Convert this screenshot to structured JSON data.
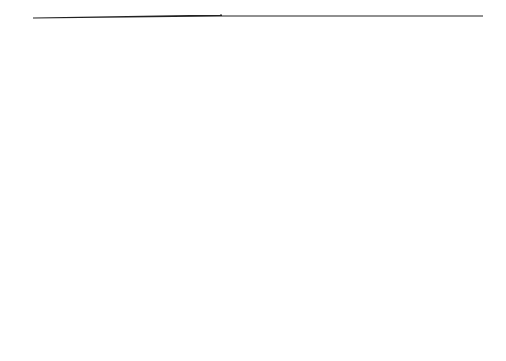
{
  "diagram": {
    "type": "entity-relationship",
    "colors": {
      "background": "#ffffff",
      "stroke": "#222222",
      "text": "#333333"
    },
    "entities": [
      {
        "id": "stock-location",
        "lines": [
          "Stock Location"
        ]
      },
      {
        "id": "warehouse",
        "lines": [
          "Warehouse"
        ]
      },
      {
        "id": "sales-office",
        "lines": [
          "Sales Office"
        ]
      },
      {
        "id": "person",
        "lines": [
          "Person"
        ]
      },
      {
        "id": "sales-person-leader",
        "lines": [
          "Sales Person",
          "(leader)"
        ]
      },
      {
        "id": "sales-person-general",
        "lines": [
          "Sales Person",
          "(general)"
        ]
      },
      {
        "id": "customer-orders",
        "lines": [
          "Customer",
          "(orders)"
        ]
      },
      {
        "id": "customer-credit",
        "lines": [
          "Customer",
          "(credit)"
        ]
      },
      {
        "id": "customer-mutations",
        "lines": [
          "Customer",
          "(mutations)"
        ]
      },
      {
        "id": "order-processing-date",
        "lines": [
          "Order Processing",
          "Date"
        ]
      },
      {
        "id": "sales-support-of-customer",
        "lines": [
          "Sales Support of",
          "Customer"
        ]
      },
      {
        "id": "order-mutations",
        "lines": [
          "Order",
          "(mutations)"
        ]
      },
      {
        "id": "order-general",
        "lines": [
          "Order",
          "(general)"
        ]
      },
      {
        "id": "order-support",
        "lines": [
          "Order",
          "(support)"
        ]
      },
      {
        "id": "payment-due-date",
        "lines": [
          "Payment",
          "Due Date"
        ]
      },
      {
        "id": "stock-type",
        "lines": [
          "Stock Type"
        ]
      },
      {
        "id": "stock",
        "lines": [
          "Stock"
        ]
      },
      {
        "id": "order-line",
        "lines": [
          "Order Line"
        ]
      },
      {
        "id": "invoice",
        "lines": [
          "Invoice"
        ]
      }
    ],
    "aggregations": [
      {
        "id": "sales-person-aggregation",
        "lines": [
          "Sales Person",
          "aggregation"
        ]
      },
      {
        "id": "customer-aggregation",
        "lines": [
          "Customer",
          "aggregation"
        ]
      },
      {
        "id": "order-aggregation",
        "lines": [
          "Order",
          "aggregation"
        ]
      }
    ],
    "relationship_labels": {
      "remainder": [
        "order",
        "generated",
        "for remainder"
      ],
      "despatched": [
        "order",
        "despatched",
        "for stock on hand"
      ]
    }
  }
}
